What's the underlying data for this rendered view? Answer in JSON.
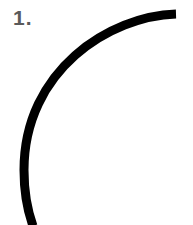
{
  "label": "1.",
  "arc": {
    "color": "#000000",
    "stroke_width": 9
  }
}
